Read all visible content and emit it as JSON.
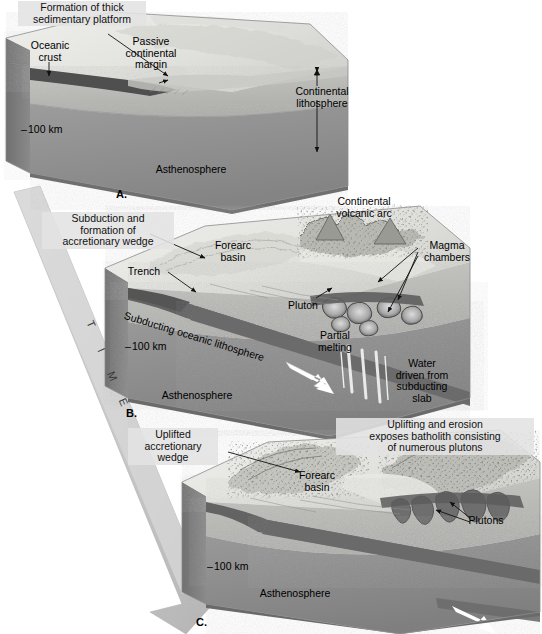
{
  "figure": {
    "type": "three-stage block diagram",
    "time_arrow": {
      "label_letters": [
        "T",
        "I",
        "M",
        "E"
      ],
      "direction": "downward to the right"
    }
  },
  "palette": {
    "background": "#ffffff",
    "surface_light": "#e9e9e6",
    "surface_mid": "#d5d5d1",
    "lithosphere": "#b9b9b6",
    "asthenosphere": "#8f8f8f",
    "asthenosphere_dark": "#7d7d7d",
    "oceanic_crust": "#5a5a5a",
    "slab_dark": "#6a6a6a",
    "pluton": "#6e6e6e",
    "magma_outline": "#4a4a4a",
    "melt_white": "#f2f2f2",
    "callout_bg": "#e2e2e2",
    "ink": "#111111",
    "time_arrow": "#c9c9c9"
  },
  "panels": [
    {
      "id": "A",
      "letter": "A.",
      "stage_name": "Passive continental margin with thick sedimentary platform",
      "labels": [
        {
          "name": "formation-of-thick-sedimentary-platform",
          "text": "Formation of thick\nsedimentary platform",
          "boxed": true
        },
        {
          "name": "oceanic-crust",
          "text": "Oceanic\ncrust",
          "boxed": false
        },
        {
          "name": "passive-continental-margin",
          "text": "Passive\ncontinental\nmargin",
          "boxed": false
        },
        {
          "name": "continental-lithosphere",
          "text": "Continental\nlithosphere",
          "boxed": false
        },
        {
          "name": "depth-100-km",
          "text": "100 km",
          "boxed": false
        },
        {
          "name": "asthenosphere",
          "text": "Asthenosphere",
          "boxed": false
        }
      ],
      "depth_marker": "100 km"
    },
    {
      "id": "B",
      "letter": "B.",
      "stage_name": "Subduction begins; volcanic arc and accretionary wedge form",
      "labels": [
        {
          "name": "subduction-and-formation-of-accretionary-wedge",
          "text": "Subduction and\nformation of\naccretionary wedge",
          "boxed": true
        },
        {
          "name": "trench",
          "text": "Trench",
          "boxed": false
        },
        {
          "name": "forearc-basin",
          "text": "Forearc\nbasin",
          "boxed": false
        },
        {
          "name": "continental-volcanic-arc",
          "text": "Continental\nvolcanic arc",
          "boxed": false
        },
        {
          "name": "magma-chambers",
          "text": "Magma\nchambers",
          "boxed": false
        },
        {
          "name": "pluton",
          "text": "Pluton",
          "boxed": false
        },
        {
          "name": "subducting-oceanic-lithosphere",
          "text": "Subducting oceanic lithosphere",
          "boxed": false
        },
        {
          "name": "partial-melting",
          "text": "Partial\nmelting",
          "boxed": false
        },
        {
          "name": "water-driven-from-subducting-slab",
          "text": "Water\ndriven from\nsubducting\nslab",
          "boxed": false
        },
        {
          "name": "depth-100-km",
          "text": "100 km",
          "boxed": false
        },
        {
          "name": "asthenosphere",
          "text": "Asthenosphere",
          "boxed": false
        }
      ],
      "depth_marker": "100 km"
    },
    {
      "id": "C",
      "letter": "C.",
      "stage_name": "Uplift and erosion expose the batholith",
      "labels": [
        {
          "name": "uplifted-accretionary-wedge",
          "text": "Uplifted\naccretionary\nwedge",
          "boxed": true
        },
        {
          "name": "uplifting-and-erosion-exposes-batholith",
          "text": "Uplifting and erosion\nexposes batholith consisting\nof numerous plutons",
          "boxed": true
        },
        {
          "name": "forearc-basin",
          "text": "Forearc\nbasin",
          "boxed": false
        },
        {
          "name": "plutons",
          "text": "Plutons",
          "boxed": false
        },
        {
          "name": "depth-100-km",
          "text": "100 km",
          "boxed": false
        },
        {
          "name": "asthenosphere",
          "text": "Asthenosphere",
          "boxed": false
        }
      ],
      "depth_marker": "100 km"
    }
  ]
}
